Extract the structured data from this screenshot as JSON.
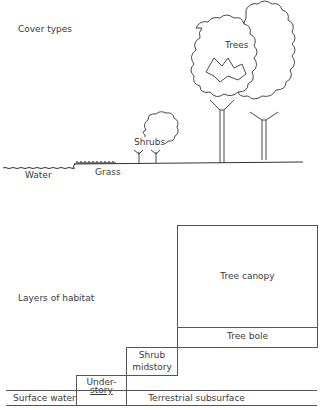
{
  "cover_types": {
    "title": "Cover types",
    "labels": {
      "water": "Water",
      "grass": "Grass",
      "shrubs": "Shrubs",
      "trees": "Trees"
    }
  },
  "layers_of_habitat": {
    "title": "Layers of habitat",
    "layers": {
      "tree_canopy": "Tree canopy",
      "tree_bole": "Tree bole",
      "shrub_midstory_1": "Shrub",
      "shrub_midstory_2": "midstory",
      "understory_1": "Under-",
      "understory_2": "story",
      "surface_water": "Surface water",
      "terrestrial_subsurface": "Terrestrial subsurface"
    }
  }
}
